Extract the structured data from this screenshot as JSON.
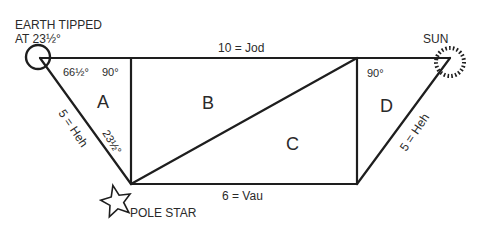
{
  "diagram": {
    "labels": {
      "earth": [
        "EARTH TIPPED",
        "AT 23½°"
      ],
      "sun": "SUN",
      "pole_star": "POLE STAR",
      "top_edge": "10 = Jod",
      "bottom_edge": "6 = Vau",
      "left_slant": "5 = Heh",
      "right_slant": "5 = Heh",
      "angle_earth": "66½°",
      "angle_top_left": "90°",
      "angle_top_right": "90°",
      "angle_pole": "23½°",
      "region_a": "A",
      "region_b": "B",
      "region_c": "C",
      "region_d": "D"
    },
    "colors": {
      "stroke": "#1e1e1e",
      "text": "#2a2a2a",
      "background": "#ffffff"
    }
  }
}
